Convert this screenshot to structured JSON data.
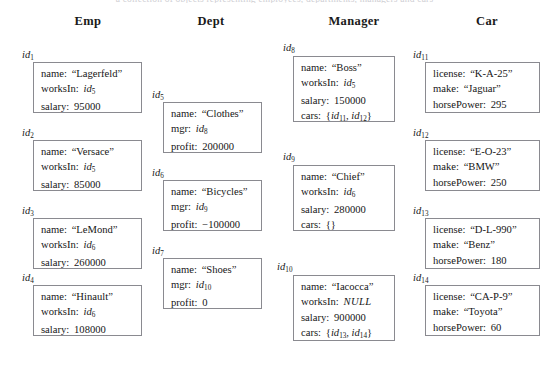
{
  "figure": {
    "top_cut_text": "a collection of objects representing employees, departments, managers and cars",
    "columns": [
      {
        "name": "Emp",
        "header": "Emp"
      },
      {
        "name": "Dept",
        "header": "Dept"
      },
      {
        "name": "Manager",
        "header": "Manager"
      },
      {
        "name": "Car",
        "header": "Car"
      }
    ],
    "objects": [
      {
        "oid": "id",
        "oid_sub": "1",
        "class": "Emp",
        "fields": [
          {
            "key": "name:",
            "value": "“Lagerfeld”",
            "kind": "string"
          },
          {
            "key": "worksIn:",
            "value": "id",
            "value_sub": "5",
            "kind": "idref"
          },
          {
            "key": "salary:",
            "value": "95000",
            "kind": "number"
          }
        ]
      },
      {
        "oid": "id",
        "oid_sub": "2",
        "class": "Emp",
        "fields": [
          {
            "key": "name:",
            "value": "“Versace”",
            "kind": "string"
          },
          {
            "key": "worksIn:",
            "value": "id",
            "value_sub": "5",
            "kind": "idref"
          },
          {
            "key": "salary:",
            "value": "85000",
            "kind": "number"
          }
        ]
      },
      {
        "oid": "id",
        "oid_sub": "3",
        "class": "Emp",
        "fields": [
          {
            "key": "name:",
            "value": "“LeMond”",
            "kind": "string"
          },
          {
            "key": "worksIn:",
            "value": "id",
            "value_sub": "6",
            "kind": "idref"
          },
          {
            "key": "salary:",
            "value": "260000",
            "kind": "number"
          }
        ]
      },
      {
        "oid": "id",
        "oid_sub": "4",
        "class": "Emp",
        "fields": [
          {
            "key": "name:",
            "value": "“Hinault”",
            "kind": "string"
          },
          {
            "key": "worksIn:",
            "value": "id",
            "value_sub": "6",
            "kind": "idref"
          },
          {
            "key": "salary:",
            "value": "108000",
            "kind": "number"
          }
        ]
      },
      {
        "oid": "id",
        "oid_sub": "5",
        "class": "Dept",
        "fields": [
          {
            "key": "name:",
            "value": "“Clothes”",
            "kind": "string"
          },
          {
            "key": "mgr:",
            "value": "id",
            "value_sub": "8",
            "kind": "idref"
          },
          {
            "key": "profit:",
            "value": "200000",
            "kind": "number"
          }
        ]
      },
      {
        "oid": "id",
        "oid_sub": "6",
        "class": "Dept",
        "fields": [
          {
            "key": "name:",
            "value": "“Bicycles”",
            "kind": "string"
          },
          {
            "key": "mgr:",
            "value": "id",
            "value_sub": "9",
            "kind": "idref"
          },
          {
            "key": "profit:",
            "value": "−100000",
            "kind": "number"
          }
        ]
      },
      {
        "oid": "id",
        "oid_sub": "7",
        "class": "Dept",
        "fields": [
          {
            "key": "name:",
            "value": "“Shoes”",
            "kind": "string"
          },
          {
            "key": "mgr:",
            "value": "id",
            "value_sub": "10",
            "kind": "idref"
          },
          {
            "key": "profit:",
            "value": "0",
            "kind": "number"
          }
        ]
      },
      {
        "oid": "id",
        "oid_sub": "8",
        "class": "Manager",
        "fields": [
          {
            "key": "name:",
            "value": "“Boss”",
            "kind": "string"
          },
          {
            "key": "worksIn:",
            "value": "id",
            "value_sub": "5",
            "kind": "idref"
          },
          {
            "key": "salary:",
            "value": "150000",
            "kind": "number"
          },
          {
            "key": "cars:",
            "value": "{id₁₁, id₁₂}",
            "kind": "set",
            "set_items": [
              {
                "value": "id",
                "value_sub": "11"
              },
              {
                "value": "id",
                "value_sub": "12"
              }
            ]
          }
        ]
      },
      {
        "oid": "id",
        "oid_sub": "9",
        "class": "Manager",
        "fields": [
          {
            "key": "name:",
            "value": "“Chief”",
            "kind": "string"
          },
          {
            "key": "worksIn:",
            "value": "id",
            "value_sub": "6",
            "kind": "idref"
          },
          {
            "key": "salary:",
            "value": "280000",
            "kind": "number"
          },
          {
            "key": "cars:",
            "value": "{}",
            "kind": "set",
            "set_items": []
          }
        ]
      },
      {
        "oid": "id",
        "oid_sub": "10",
        "class": "Manager",
        "fields": [
          {
            "key": "name:",
            "value": "“Iacocca”",
            "kind": "string"
          },
          {
            "key": "worksIn:",
            "value": "NULL",
            "kind": "null"
          },
          {
            "key": "salary:",
            "value": "900000",
            "kind": "number"
          },
          {
            "key": "cars:",
            "value": "{id₁₃, id₁₄}",
            "kind": "set",
            "set_items": [
              {
                "value": "id",
                "value_sub": "13"
              },
              {
                "value": "id",
                "value_sub": "14"
              }
            ]
          }
        ]
      },
      {
        "oid": "id",
        "oid_sub": "11",
        "class": "Car",
        "fields": [
          {
            "key": "license:",
            "value": "“K-A-25”",
            "kind": "string"
          },
          {
            "key": "make:",
            "value": "“Jaguar”",
            "kind": "string"
          },
          {
            "key": "horsePower:",
            "value": "295",
            "kind": "number"
          }
        ]
      },
      {
        "oid": "id",
        "oid_sub": "12",
        "class": "Car",
        "fields": [
          {
            "key": "license:",
            "value": "“E-O-23”",
            "kind": "string"
          },
          {
            "key": "make:",
            "value": "“BMW”",
            "kind": "string"
          },
          {
            "key": "horsePower:",
            "value": "250",
            "kind": "number"
          }
        ]
      },
      {
        "oid": "id",
        "oid_sub": "13",
        "class": "Car",
        "fields": [
          {
            "key": "license:",
            "value": "“D-L-990”",
            "kind": "string"
          },
          {
            "key": "make:",
            "value": "“Benz”",
            "kind": "string"
          },
          {
            "key": "horsePower:",
            "value": "180",
            "kind": "number"
          }
        ]
      },
      {
        "oid": "id",
        "oid_sub": "14",
        "class": "Car",
        "fields": [
          {
            "key": "license:",
            "value": "“CA-P-9”",
            "kind": "string"
          },
          {
            "key": "make:",
            "value": "“Toyota”",
            "kind": "string"
          },
          {
            "key": "horsePower:",
            "value": "60",
            "kind": "number"
          }
        ]
      }
    ],
    "colors": {
      "page_background": "#ffffff",
      "box_border": "#8a8a90",
      "text": "#1a1a1a"
    }
  }
}
